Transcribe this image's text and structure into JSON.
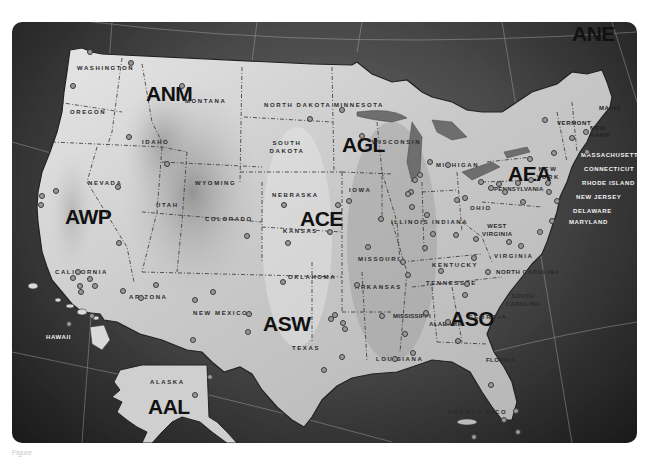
{
  "map": {
    "title": "FAA Regions of the United States",
    "regions": [
      {
        "code": "ANE",
        "x": 572,
        "y": 8
      },
      {
        "code": "ANM",
        "x": 134,
        "y": 60
      },
      {
        "code": "AGL",
        "x": 330,
        "y": 111
      },
      {
        "code": "AEA",
        "x": 496,
        "y": 140
      },
      {
        "code": "AWP",
        "x": 53,
        "y": 183
      },
      {
        "code": "ACE",
        "x": 288,
        "y": 185
      },
      {
        "code": "ASO",
        "x": 438,
        "y": 285
      },
      {
        "code": "ASW",
        "x": 251,
        "y": 290
      },
      {
        "code": "AAL",
        "x": 136,
        "y": 373
      }
    ],
    "states": [
      {
        "name": "WASHINGTON",
        "x": 65,
        "y": 43
      },
      {
        "name": "OREGON",
        "x": 58,
        "y": 87
      },
      {
        "name": "MONTANA",
        "x": 173,
        "y": 76
      },
      {
        "name": "IDAHO",
        "x": 130,
        "y": 117
      },
      {
        "name": "WYOMING",
        "x": 183,
        "y": 158
      },
      {
        "name": "NORTH DAKOTA",
        "x": 252,
        "y": 80
      },
      {
        "name": "SOUTH DAKOTA",
        "x": 260,
        "y": 121
      },
      {
        "name": "MINNESOTA",
        "x": 322,
        "y": 80
      },
      {
        "name": "WISCONSIN",
        "x": 360,
        "y": 117
      },
      {
        "name": "MICHIGAN",
        "x": 424,
        "y": 140
      },
      {
        "name": "NEVADA",
        "x": 76,
        "y": 158
      },
      {
        "name": "UTAH",
        "x": 144,
        "y": 180
      },
      {
        "name": "COLORADO",
        "x": 193,
        "y": 194
      },
      {
        "name": "NEBRASKA",
        "x": 260,
        "y": 170
      },
      {
        "name": "IOWA",
        "x": 337,
        "y": 165
      },
      {
        "name": "ILLINOIS",
        "x": 379,
        "y": 197
      },
      {
        "name": "INDIANA",
        "x": 420,
        "y": 197
      },
      {
        "name": "OHIO",
        "x": 458,
        "y": 183
      },
      {
        "name": "KANSAS",
        "x": 271,
        "y": 206
      },
      {
        "name": "MISSOURI",
        "x": 346,
        "y": 234
      },
      {
        "name": "KENTUCKY",
        "x": 420,
        "y": 240
      },
      {
        "name": "WEST\nVIRGINIA",
        "x": 473,
        "y": 204
      },
      {
        "name": "VIRGINIA",
        "x": 482,
        "y": 231
      },
      {
        "name": "NEW YORK",
        "x": 528,
        "y": 147
      },
      {
        "name": "PENNSYLVANIA",
        "x": 482,
        "y": 164
      },
      {
        "name": "CALIFORNIA",
        "x": 43,
        "y": 247
      },
      {
        "name": "ARIZONA",
        "x": 117,
        "y": 272
      },
      {
        "name": "NEW MEXICO",
        "x": 181,
        "y": 288
      },
      {
        "name": "OKLAHOMA",
        "x": 276,
        "y": 252
      },
      {
        "name": "ARKANSAS",
        "x": 343,
        "y": 262
      },
      {
        "name": "TENNESSEE",
        "x": 414,
        "y": 258
      },
      {
        "name": "NORTH CAROLINA",
        "x": 484,
        "y": 247
      },
      {
        "name": "SOUTH\nCAROLINA",
        "x": 495,
        "y": 274
      },
      {
        "name": "MISSISSIPPI",
        "x": 381,
        "y": 291
      },
      {
        "name": "ALABAMA",
        "x": 417,
        "y": 299
      },
      {
        "name": "GEORGIA",
        "x": 456,
        "y": 292
      },
      {
        "name": "TEXAS",
        "x": 280,
        "y": 323
      },
      {
        "name": "LOUISIANA",
        "x": 364,
        "y": 334
      },
      {
        "name": "FLORIDA",
        "x": 474,
        "y": 335
      },
      {
        "name": "HAWAII",
        "x": 34,
        "y": 312
      },
      {
        "name": "ALASKA",
        "x": 138,
        "y": 357
      },
      {
        "name": "PUERTO RICO",
        "x": 436,
        "y": 387
      }
    ],
    "states_coastal_light": [
      {
        "name": "VERMONT",
        "x": 545,
        "y": 98
      },
      {
        "name": "NEW\nHAMP",
        "x": 580,
        "y": 107
      },
      {
        "name": "MAINE",
        "x": 587,
        "y": 83
      },
      {
        "name": "MASSACHUSETTS",
        "x": 569,
        "y": 130
      },
      {
        "name": "CONNECTICUT",
        "x": 572,
        "y": 144
      },
      {
        "name": "RHODE ISLAND",
        "x": 570,
        "y": 158
      },
      {
        "name": "NEW JERSEY",
        "x": 564,
        "y": 172
      },
      {
        "name": "DELAWARE",
        "x": 561,
        "y": 186
      },
      {
        "name": "MARYLAND",
        "x": 557,
        "y": 197
      }
    ],
    "offices": [
      [
        78,
        30
      ],
      [
        119,
        41
      ],
      [
        61,
        64
      ],
      [
        170,
        64
      ],
      [
        117,
        115
      ],
      [
        155,
        142
      ],
      [
        106,
        165
      ],
      [
        44,
        169
      ],
      [
        30,
        174
      ],
      [
        29,
        183
      ],
      [
        107,
        221
      ],
      [
        66,
        250
      ],
      [
        61,
        256
      ],
      [
        78,
        257
      ],
      [
        68,
        264
      ],
      [
        83,
        264
      ],
      [
        69,
        270
      ],
      [
        144,
        263
      ],
      [
        235,
        214
      ],
      [
        201,
        270
      ],
      [
        183,
        278
      ],
      [
        237,
        292
      ],
      [
        129,
        276
      ],
      [
        330,
        88
      ],
      [
        298,
        97
      ],
      [
        350,
        114
      ],
      [
        337,
        179
      ],
      [
        326,
        183
      ],
      [
        272,
        183
      ],
      [
        318,
        210
      ],
      [
        276,
        221
      ],
      [
        356,
        225
      ],
      [
        369,
        197
      ],
      [
        399,
        170
      ],
      [
        396,
        172
      ],
      [
        403,
        158
      ],
      [
        408,
        153
      ],
      [
        418,
        140
      ],
      [
        436,
        143
      ],
      [
        400,
        185
      ],
      [
        415,
        193
      ],
      [
        445,
        178
      ],
      [
        453,
        176
      ],
      [
        444,
        213
      ],
      [
        464,
        217
      ],
      [
        469,
        160
      ],
      [
        479,
        166
      ],
      [
        487,
        162
      ],
      [
        493,
        170
      ],
      [
        518,
        137
      ],
      [
        533,
        98
      ],
      [
        560,
        116
      ],
      [
        574,
        110
      ],
      [
        537,
        170
      ],
      [
        545,
        179
      ],
      [
        540,
        199
      ],
      [
        528,
        210
      ],
      [
        506,
        161
      ],
      [
        511,
        180
      ],
      [
        519,
        158
      ],
      [
        536,
        161
      ],
      [
        542,
        131
      ],
      [
        575,
        130
      ],
      [
        421,
        212
      ],
      [
        413,
        226
      ],
      [
        391,
        240
      ],
      [
        396,
        253
      ],
      [
        429,
        249
      ],
      [
        462,
        236
      ],
      [
        453,
        273
      ],
      [
        455,
        262
      ],
      [
        476,
        250
      ],
      [
        497,
        220
      ],
      [
        509,
        224
      ],
      [
        414,
        291
      ],
      [
        393,
        312
      ],
      [
        401,
        331
      ],
      [
        436,
        300
      ],
      [
        446,
        319
      ],
      [
        479,
        363
      ],
      [
        504,
        389
      ],
      [
        492,
        398
      ],
      [
        506,
        410
      ],
      [
        462,
        415
      ],
      [
        330,
        335
      ],
      [
        383,
        337
      ],
      [
        331,
        301
      ],
      [
        323,
        293
      ],
      [
        319,
        297
      ],
      [
        333,
        307
      ],
      [
        312,
        348
      ],
      [
        271,
        260
      ],
      [
        236,
        310
      ],
      [
        345,
        263
      ],
      [
        370,
        294
      ],
      [
        57,
        302
      ],
      [
        198,
        355
      ],
      [
        183,
        373
      ],
      [
        228,
        424
      ],
      [
        181,
        318
      ],
      [
        80,
        294
      ],
      [
        111,
        269
      ]
    ]
  },
  "caption": "Figure"
}
